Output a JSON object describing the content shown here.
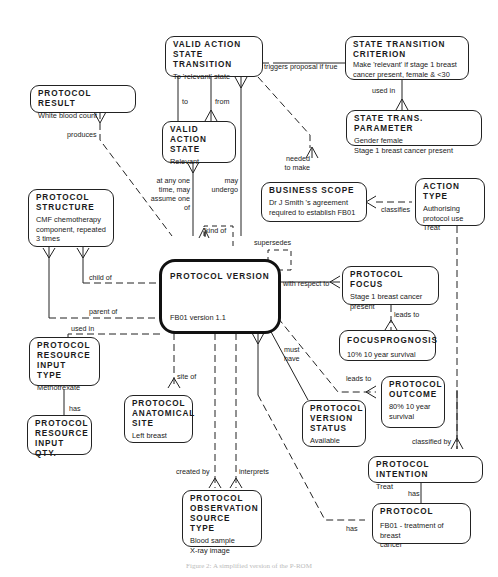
{
  "entities": {
    "valid_action_state_transition": {
      "name": "VALID ACTION\nSTATE  TRANSITION",
      "desc": "To 'relevant' state"
    },
    "state_transition_criterion": {
      "name": "STATE  TRANSITION\nCRITERION",
      "desc": "Make 'relevant' if stage 1 breast\ncancer present, female & <30"
    },
    "protocol_result": {
      "name": "PROTOCOL  RESULT",
      "desc": "White blood count"
    },
    "state_trans_parameter": {
      "name": "STATE  TRANS.  PARAMETER",
      "desc": "Gender female\nStage 1 breast cancer present"
    },
    "valid_action_state": {
      "name": "VALID  ACTION\nSTATE",
      "desc": "Relevant"
    },
    "business_scope": {
      "name": "BUSINESS  SCOPE",
      "desc": "Dr J Smith 's  agreement\nrequired to establish FB01"
    },
    "action_type": {
      "name": "ACTION  TYPE",
      "desc": "Authorising\nprotocol use\nTreat"
    },
    "protocol_structure": {
      "name": "PROTOCOL\nSTRUCTURE",
      "desc": "CMF chemotherapy\ncomponent, repeated\n3  times"
    },
    "protocol_version": {
      "name": "PROTOCOL  VERSION",
      "desc": "FB01  version 1.1"
    },
    "protocol_focus": {
      "name": "PROTOCOL  FOCUS",
      "desc": "Stage 1 breast  cancer\npresent"
    },
    "focus_prognosis": {
      "name": "FOCUSPROGNOSIS",
      "desc": "10%  10 year  survival"
    },
    "protocol_resource_input_type": {
      "name": "PROTOCOL\nRESOURCE\nINPUT  TYPE",
      "desc": "Methotrexate"
    },
    "protocol_outcome": {
      "name": "PROTOCOL\nOUTCOME",
      "desc": "80%  10 year\nsurvival"
    },
    "protocol_anatomical_site": {
      "name": "PROTOCOL\nANATOMICAL\nSITE",
      "desc": "Left breast"
    },
    "protocol_version_status": {
      "name": "PROTOCOL\nVERSION\nSTATUS",
      "desc": "Available"
    },
    "protocol_resource_input_qty": {
      "name": "PROTOCOL\nRESOURCE\nINPUT  QTY.",
      "desc": ""
    },
    "protocol_intention": {
      "name": "PROTOCOL  INTENTION",
      "desc": "Treat"
    },
    "protocol_observation_source_type": {
      "name": "PROTOCOL\nOBSERVATION\nSOURCE  TYPE",
      "desc": "Blood sample\nX-ray image"
    },
    "protocol": {
      "name": "PROTOCOL",
      "desc": "FB01 - treatment of breast\ncancer"
    }
  },
  "relationships": {
    "triggers_proposal": "triggers proposal if true",
    "to": "to",
    "from": "from",
    "used_in_criterion": "used in",
    "produces": "produces",
    "needed_to_make": "needed\nto make",
    "at_any_one_time": "at any one\ntime, may\nassume one\nof",
    "may_undergo": "may\nundergo",
    "classifies": "classifies",
    "kind_of": "kind of",
    "supersedes": "supersedes",
    "child_of": "child of",
    "parent_of": "parent of",
    "with_respect_to": "with respect to",
    "used_in_resource": "used in",
    "leads_to_prognosis": "leads to",
    "must_have": "must\nhave",
    "leads_to_outcome": "leads to",
    "site_of": "site of",
    "has_qty": "has",
    "classified_by": "classified by",
    "created_by": "created by",
    "interprets": "interprets",
    "has_intention": "has",
    "has_protocol": "has"
  },
  "caption": "Figure 2: A simplified version of the P-ROM"
}
